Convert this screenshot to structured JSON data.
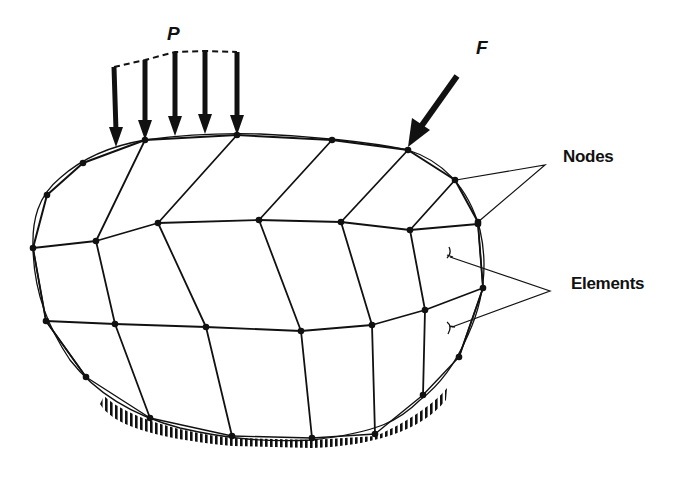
{
  "diagram": {
    "labels": {
      "distributed_load": "P",
      "point_force": "F",
      "nodes": "Nodes",
      "elements": "Elements"
    },
    "mesh": {
      "rows": 4,
      "cols": 7,
      "element_count": 18,
      "node_grid_description": "4 rows x 7 columns of nodes forming quadrilateral elements"
    },
    "loads": [
      {
        "name": "distributed-load",
        "label": "P",
        "arrow_count": 5,
        "direction": "down"
      },
      {
        "name": "point-force",
        "label": "F",
        "direction": "down-left"
      }
    ],
    "support": {
      "type": "fixed-ground",
      "location": "bottom"
    },
    "colors": {
      "ink": "#111111",
      "background": "#ffffff"
    }
  }
}
